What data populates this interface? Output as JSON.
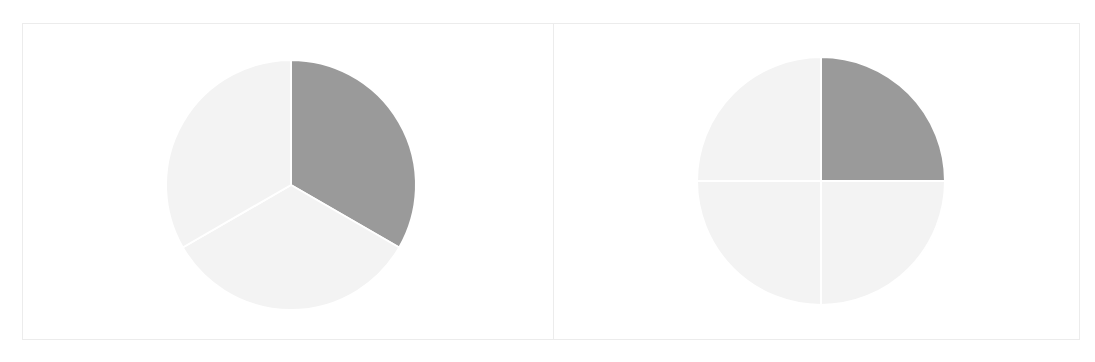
{
  "colors": {
    "shaded": "#9a9a9a",
    "unshaded": "#f3f3f3",
    "divider": "#ffffff",
    "panel_border": "#ececec",
    "background": "#ffffff"
  },
  "chart_data": [
    {
      "type": "pie",
      "title": "",
      "description": "Circle divided into 3 equal parts, 1 part shaded",
      "categories": [
        "shaded",
        "unshaded",
        "unshaded"
      ],
      "values": [
        1,
        1,
        1
      ],
      "fraction_shaded": "1/3",
      "shaded_parts": 1,
      "total_parts": 3,
      "start_angle_deg": 0,
      "direction": "clockwise",
      "legend": false,
      "labels": false
    },
    {
      "type": "pie",
      "title": "",
      "description": "Circle divided into 4 equal parts, 1 part shaded",
      "categories": [
        "shaded",
        "unshaded",
        "unshaded",
        "unshaded"
      ],
      "values": [
        1,
        1,
        1,
        1
      ],
      "fraction_shaded": "1/4",
      "shaded_parts": 1,
      "total_parts": 4,
      "start_angle_deg": 0,
      "direction": "clockwise",
      "legend": false,
      "labels": false
    }
  ],
  "panels": [
    {
      "name": "thirds-panel",
      "cx": 268,
      "cy": 161,
      "r": 125
    },
    {
      "name": "quarters-panel",
      "cx": 267,
      "cy": 157,
      "r": 124
    }
  ]
}
